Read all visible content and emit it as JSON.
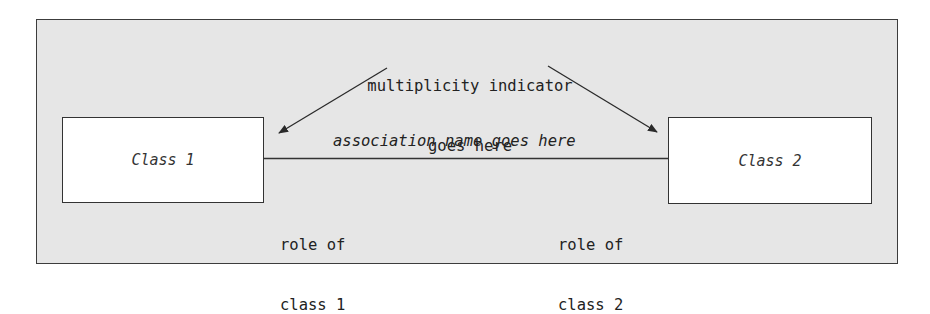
{
  "diagram": {
    "type": "uml-association",
    "annotation_top": {
      "line1": "multiplicity indicator",
      "line2": "goes here"
    },
    "association_label": "association name goes here",
    "classes": [
      {
        "name": "Class 1"
      },
      {
        "name": "Class 2"
      }
    ],
    "roles": [
      {
        "line1": "role of",
        "line2": "class 1"
      },
      {
        "line1": "role of",
        "line2": "class 2"
      }
    ],
    "colors": {
      "background": "#e6e6e6",
      "box_fill": "#ffffff",
      "stroke": "#333333"
    }
  }
}
